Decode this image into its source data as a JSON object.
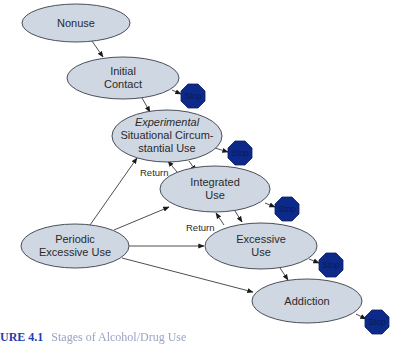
{
  "diagram": {
    "colors": {
      "node_fill": "#cfd7e3",
      "node_stroke": "#4a4f58",
      "stop_fill": "#0d2a8a",
      "edge": "#3a3a3a",
      "caption_label": "#1f3fa8"
    },
    "nodes": {
      "nonuse": {
        "label": "Nonuse"
      },
      "initial_contact": {
        "line1": "Initial",
        "line2": "Contact"
      },
      "experimental": {
        "line1": "Experimental",
        "line2": "Situational Circum-",
        "line3": "stantial Use"
      },
      "integrated": {
        "line1": "Integrated",
        "line2": "Use"
      },
      "periodic": {
        "line1": "Periodic",
        "line2": "Excessive Use"
      },
      "excessive": {
        "line1": "Excessive",
        "line2": "Use"
      },
      "addiction": {
        "label": "Addiction"
      }
    },
    "stops": [
      {
        "label": "Stop"
      },
      {
        "label": "Stop"
      },
      {
        "label": "Stop"
      },
      {
        "label": "Stop"
      },
      {
        "label": "Stop"
      }
    ],
    "edge_labels": {
      "return_1": "Return",
      "return_2": "Return"
    }
  },
  "caption": {
    "label": "URE 4.1",
    "rest": "Stages of Alcohol/Drug Use"
  }
}
